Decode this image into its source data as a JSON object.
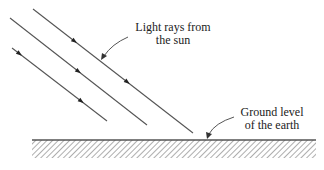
{
  "diagram": {
    "type": "physics-illustration",
    "labels": {
      "sun_rays": [
        "Light rays from",
        "the sun"
      ],
      "ground": [
        "Ground level",
        "of the earth"
      ]
    },
    "colors": {
      "line": "#555555",
      "text": "#222222",
      "hatch": "#777777"
    },
    "rays": [
      {
        "id": "ray-1",
        "x1": 33,
        "y1": 9,
        "x2": 193,
        "y2": 133,
        "arrows": [
          0.26,
          0.59
        ]
      },
      {
        "id": "ray-2",
        "x1": 10,
        "y1": 18,
        "x2": 147,
        "y2": 125,
        "arrows": [
          0.5
        ]
      },
      {
        "id": "ray-3",
        "x1": 12,
        "y1": 48,
        "x2": 107,
        "y2": 121,
        "arrows": [
          0.08,
          0.73
        ]
      }
    ],
    "ground": {
      "x1": 32,
      "x2": 316,
      "y": 140,
      "hatch_bottom": 158
    }
  }
}
